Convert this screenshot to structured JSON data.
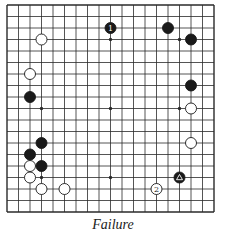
{
  "diagram": {
    "type": "go-board",
    "size": 19,
    "visible_region": "full board",
    "caption": "Failure",
    "colors": {
      "line": "#2a2a2a",
      "black_stone": "#1a1a1a",
      "white_stone": "#ffffff",
      "background": "#ffffff"
    },
    "star_points": [
      [
        3,
        3
      ],
      [
        3,
        9
      ],
      [
        3,
        15
      ],
      [
        9,
        3
      ],
      [
        9,
        9
      ],
      [
        9,
        15
      ],
      [
        15,
        3
      ],
      [
        15,
        9
      ],
      [
        15,
        15
      ]
    ],
    "stones": [
      {
        "color": "black",
        "col": 9,
        "row": 2,
        "label": "1"
      },
      {
        "color": "black",
        "col": 14,
        "row": 2,
        "label": ""
      },
      {
        "color": "black",
        "col": 16,
        "row": 3,
        "label": ""
      },
      {
        "color": "white",
        "col": 3,
        "row": 3,
        "label": ""
      },
      {
        "color": "white",
        "col": 2,
        "row": 6,
        "label": ""
      },
      {
        "color": "black",
        "col": 2,
        "row": 8,
        "label": ""
      },
      {
        "color": "black",
        "col": 16,
        "row": 7,
        "label": ""
      },
      {
        "color": "white",
        "col": 16,
        "row": 9,
        "label": ""
      },
      {
        "color": "white",
        "col": 16,
        "row": 12,
        "label": ""
      },
      {
        "color": "black",
        "col": 3,
        "row": 12,
        "label": ""
      },
      {
        "color": "black",
        "col": 2,
        "row": 13,
        "label": ""
      },
      {
        "color": "black",
        "col": 3,
        "row": 14,
        "label": ""
      },
      {
        "color": "white",
        "col": 2,
        "row": 14,
        "label": ""
      },
      {
        "color": "white",
        "col": 2,
        "row": 15,
        "label": ""
      },
      {
        "color": "white",
        "col": 3,
        "row": 16,
        "label": ""
      },
      {
        "color": "white",
        "col": 5,
        "row": 16,
        "label": ""
      },
      {
        "color": "black",
        "col": 15,
        "row": 15,
        "label": "",
        "marker": "triangle"
      },
      {
        "color": "white",
        "col": 13,
        "row": 16,
        "label": "2"
      }
    ]
  }
}
